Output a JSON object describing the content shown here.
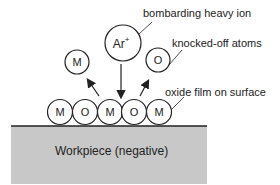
{
  "diagram": {
    "labels": {
      "bombarding_ion": "bombarding heavy ion",
      "knocked_off": "knocked-off atoms",
      "oxide_film": "oxide film on surface",
      "workpiece": "Workpiece (negative)"
    },
    "ion": {
      "symbol": "Ar",
      "charge": "+"
    },
    "ejected_atoms": [
      "M",
      "O"
    ],
    "surface_atoms": [
      "M",
      "O",
      "M",
      "O",
      "M"
    ],
    "colors": {
      "workpiece_fill": "#c8c8c8",
      "stroke": "#222222"
    }
  }
}
